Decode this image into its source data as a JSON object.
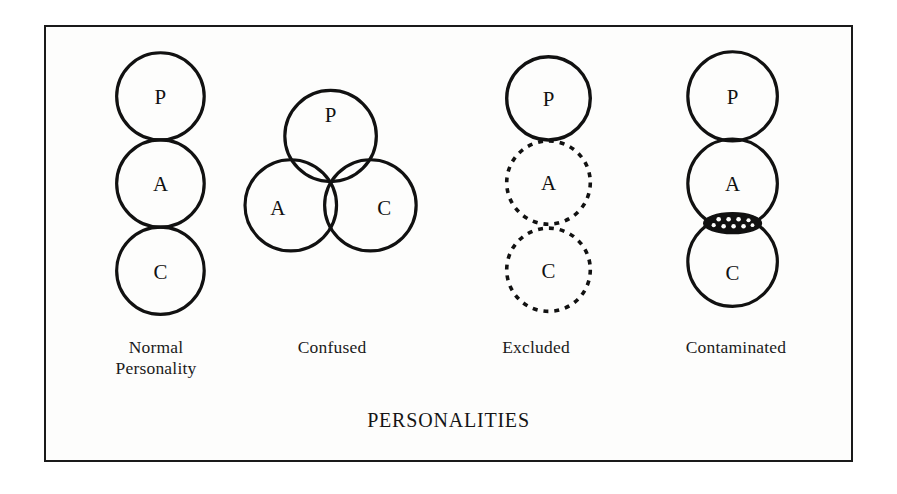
{
  "figure": {
    "title": "PERSONALITIES",
    "border_color": "#1a1a1a",
    "background_color": "#fdfdfc",
    "stroke_color": "#111111"
  },
  "panels": [
    {
      "id": "normal",
      "caption": "Normal\nPersonality",
      "style": "stacked-tangent",
      "circles": [
        {
          "label": "P",
          "cx": 115,
          "cy": 70,
          "r": 44,
          "stroke": "solid"
        },
        {
          "label": "A",
          "cx": 115,
          "cy": 158,
          "r": 44,
          "stroke": "solid"
        },
        {
          "label": "C",
          "cx": 115,
          "cy": 246,
          "r": 44,
          "stroke": "solid"
        }
      ]
    },
    {
      "id": "confused",
      "caption": "Confused",
      "style": "venn-overlap",
      "circles": [
        {
          "label": "P",
          "cx": 286,
          "cy": 110,
          "r": 46,
          "stroke": "solid"
        },
        {
          "label": "A",
          "cx": 246,
          "cy": 180,
          "r": 46,
          "stroke": "solid"
        },
        {
          "label": "C",
          "cx": 326,
          "cy": 180,
          "r": 46,
          "stroke": "solid"
        }
      ]
    },
    {
      "id": "excluded",
      "caption": "Excluded",
      "style": "stacked-dashed",
      "circles": [
        {
          "label": "P",
          "cx": 505,
          "cy": 72,
          "r": 42,
          "stroke": "solid"
        },
        {
          "label": "A",
          "cx": 505,
          "cy": 157,
          "r": 42,
          "stroke": "dotted"
        },
        {
          "label": "C",
          "cx": 505,
          "cy": 245,
          "r": 42,
          "stroke": "dotted"
        }
      ]
    },
    {
      "id": "contaminated",
      "caption": "Contaminated",
      "style": "stacked-contaminated",
      "circles": [
        {
          "label": "P",
          "cx": 690,
          "cy": 70,
          "r": 45,
          "stroke": "solid"
        },
        {
          "label": "A",
          "cx": 690,
          "cy": 158,
          "r": 45,
          "stroke": "solid"
        },
        {
          "label": "C",
          "cx": 690,
          "cy": 237,
          "r": 45,
          "stroke": "solid"
        }
      ],
      "contamination": {
        "cx": 690,
        "cy": 198,
        "rx": 29,
        "ry": 10,
        "fill": "#111111",
        "speck_fill": "#ffffff",
        "speck_count": 9
      }
    }
  ]
}
